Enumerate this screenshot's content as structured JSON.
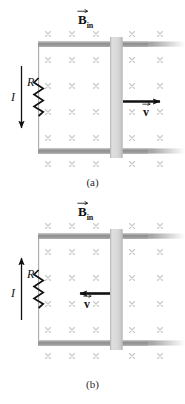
{
  "figure": {
    "kind": "physics-diagram",
    "panels": [
      {
        "id": "a",
        "caption": "(a)",
        "field_label": {
          "symbol": "B",
          "subscript": "in",
          "vector": true
        },
        "resistor_label": "R",
        "current_label": "I",
        "current_direction": "down",
        "velocity_label": "v",
        "velocity_vector": true,
        "velocity_direction": "right"
      },
      {
        "id": "b",
        "caption": "(b)",
        "field_label": {
          "symbol": "B",
          "subscript": "in",
          "vector": true
        },
        "resistor_label": "R",
        "current_label": "I",
        "current_direction": "up",
        "velocity_label": "v",
        "velocity_vector": true,
        "velocity_direction": "left"
      }
    ],
    "field_marks": {
      "glyph": "×",
      "columns": 5,
      "rows": 6,
      "color": "#c8c8c8"
    },
    "colors": {
      "rail": "#8a8a8a",
      "rail_highlight": "#b4b4b4",
      "slider_bar": "#d4d4d4",
      "slider_bar_edge": "#bdbdbd",
      "wire": "#a0a0a0",
      "arrow": "#111111",
      "resistor": "#111111",
      "field_mark": "#c8c8c8",
      "caption": "#2b2b2b",
      "background": "#ffffff"
    }
  }
}
